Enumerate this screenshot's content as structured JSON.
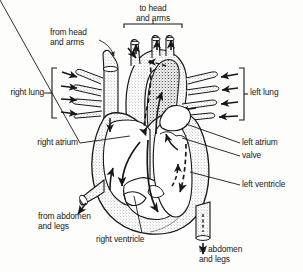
{
  "diagram": {
    "type": "anatomical-line-drawing",
    "background_color": "#fdfdfb",
    "ink_color": "#17171a",
    "stipple_color": "#7a7a7a"
  },
  "labels": {
    "to_head_and_arms": "to head\nand arms",
    "from_head_and_arms": "from head\nand arms",
    "right_lung": "right lung",
    "left_lung": "left lung",
    "right_atrium": "right atrium",
    "left_atrium": "left atrium",
    "valve": "valve",
    "left_ventricle": "left ventricle",
    "right_ventricle": "right ventricle",
    "from_abdomen_and_legs": "from abdomen\nand legs",
    "to_abdomen_and_legs": "to abdomen\nand legs"
  }
}
